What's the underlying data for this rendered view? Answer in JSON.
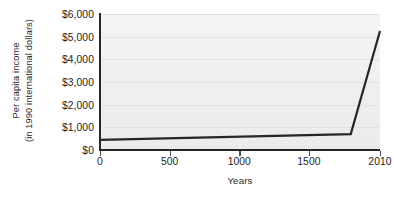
{
  "chart_data": {
    "type": "line",
    "title": "",
    "xlabel": "Years",
    "ylabel_lines": [
      "Per capita income",
      "(in 1990 international dollars)"
    ],
    "ylabel": "Per capita income (in 1990 international dollars)",
    "x": [
      0,
      1800,
      2010
    ],
    "values": [
      450,
      700,
      5250
    ],
    "series": [
      {
        "name": "Per capita income",
        "points": [
          {
            "x": 0,
            "y": 450
          },
          {
            "x": 1800,
            "y": 700
          },
          {
            "x": 2010,
            "y": 5250
          }
        ]
      }
    ],
    "xticks": [
      {
        "value": 0,
        "label": "0"
      },
      {
        "value": 500,
        "label": "500"
      },
      {
        "value": 1000,
        "label": "1000"
      },
      {
        "value": 1500,
        "label": "1500"
      },
      {
        "value": 2010,
        "label": "2010"
      }
    ],
    "yticks": [
      {
        "value": 0,
        "label": "$0"
      },
      {
        "value": 1000,
        "label": "$1,000"
      },
      {
        "value": 2000,
        "label": "$2,000"
      },
      {
        "value": 3000,
        "label": "$3,000"
      },
      {
        "value": 4000,
        "label": "$4,000"
      },
      {
        "value": 5000,
        "label": "$5,000"
      },
      {
        "value": 6000,
        "label": "$6,000"
      }
    ],
    "xlim": [
      0,
      2010
    ],
    "ylim": [
      0,
      6000
    ],
    "grid": true,
    "legend": false,
    "colors": {
      "line": "#262626",
      "plot_background": "#f1f1f0",
      "gridline": "#e2e2e0",
      "axis": "#262626",
      "text": "#1d1d1d"
    }
  }
}
